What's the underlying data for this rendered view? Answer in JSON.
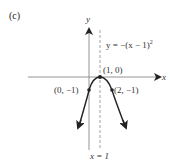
{
  "panel_label": "(c)",
  "axes": {
    "x_label": "x",
    "y_label": "y"
  },
  "equation": {
    "prefix": "y = −(x − 1)",
    "exponent": "2"
  },
  "asymptote_label": "x = 1",
  "points": [
    {
      "label": "(1, 0)",
      "x": 1,
      "y": 0
    },
    {
      "label": "(0, −1)",
      "x": 0,
      "y": -1
    },
    {
      "label": "(2, −1)",
      "x": 2,
      "y": -1
    }
  ],
  "colors": {
    "curve": "#222222",
    "axis": "#888888",
    "dashed": "#999999"
  }
}
